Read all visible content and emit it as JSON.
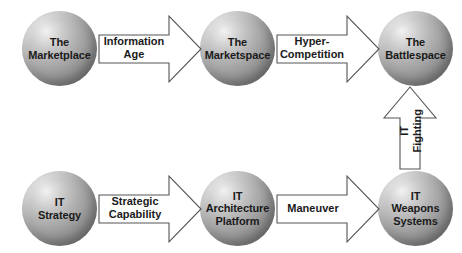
{
  "diagram": {
    "background_color": "#ffffff",
    "text_color": "#1a1a1a",
    "arrow_fill": "#ffffff",
    "arrow_stroke": "#555555",
    "sphere_highlight_color": "#f2f2f2",
    "sphere_edge_color": "#666666"
  },
  "nodes": [
    {
      "id": "marketplace",
      "name": "node-marketplace",
      "lines": [
        "The",
        "Marketplace"
      ],
      "row": "top",
      "column": 1
    },
    {
      "id": "marketspace",
      "name": "node-marketspace",
      "lines": [
        "The",
        "Marketspace"
      ],
      "row": "top",
      "column": 2
    },
    {
      "id": "battlespace",
      "name": "node-battlespace",
      "lines": [
        "The",
        "Battlespace"
      ],
      "row": "top",
      "column": 3
    },
    {
      "id": "it-strategy",
      "name": "node-it-strategy",
      "lines": [
        "IT",
        "Strategy"
      ],
      "row": "bottom",
      "column": 1
    },
    {
      "id": "it-architecture-platform",
      "name": "node-it-architecture-platform",
      "lines": [
        "IT",
        "Architecture",
        "Platform"
      ],
      "row": "bottom",
      "column": 2
    },
    {
      "id": "it-weapons-systems",
      "name": "node-it-weapons-systems",
      "lines": [
        "IT",
        "Weapons",
        "Systems"
      ],
      "row": "bottom",
      "column": 3
    }
  ],
  "arrows": [
    {
      "id": "information-age",
      "name": "arrow-information-age",
      "lines": [
        "Information",
        "Age"
      ],
      "direction": "right",
      "from": "marketplace",
      "to": "marketspace"
    },
    {
      "id": "hyper-competition",
      "name": "arrow-hyper-competition",
      "lines": [
        "Hyper-",
        "Competition"
      ],
      "direction": "right",
      "from": "marketspace",
      "to": "battlespace"
    },
    {
      "id": "strategic-capability",
      "name": "arrow-strategic-capability",
      "lines": [
        "Strategic",
        "Capability"
      ],
      "direction": "right",
      "from": "it-strategy",
      "to": "it-architecture-platform"
    },
    {
      "id": "maneuver",
      "name": "arrow-maneuver",
      "lines": [
        "Maneuver"
      ],
      "direction": "right",
      "from": "it-architecture-platform",
      "to": "it-weapons-systems"
    },
    {
      "id": "it-fighting",
      "name": "arrow-it-fighting",
      "lines": [
        "IT",
        "Fighting"
      ],
      "direction": "up",
      "from": "it-weapons-systems",
      "to": "battlespace"
    }
  ]
}
